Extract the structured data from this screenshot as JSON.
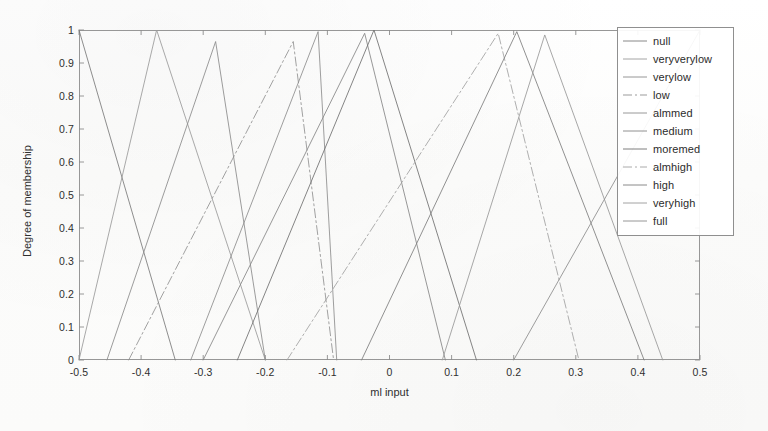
{
  "chart_data": {
    "type": "line",
    "title": "",
    "subtitle": "",
    "xlabel": "ml input",
    "ylabel": "Degree of membership",
    "xlim": [
      -0.5,
      0.5
    ],
    "ylim": [
      0,
      1
    ],
    "xticks": [
      "-0.5",
      "-0.4",
      "-0.3",
      "-0.2",
      "-0.1",
      "0",
      "0.1",
      "0.2",
      "0.3",
      "0.4",
      "0.5"
    ],
    "xtick_values": [
      -0.5,
      -0.4,
      -0.3,
      -0.2,
      -0.1,
      0,
      0.1,
      0.2,
      0.3,
      0.4,
      0.5
    ],
    "yticks": [
      "0",
      "0.1",
      "0.2",
      "0.3",
      "0.4",
      "0.5",
      "0.6",
      "0.7",
      "0.8",
      "0.9",
      "1"
    ],
    "ytick_values": [
      0,
      0.1,
      0.2,
      0.3,
      0.4,
      0.5,
      0.6,
      0.7,
      0.8,
      0.9,
      1
    ],
    "grid": false,
    "legend_position": "top-right",
    "line_color": "#6e6e6e",
    "series": [
      {
        "name": "null",
        "style": "solid",
        "color": "#7a7a7a",
        "x": [
          -0.5,
          -0.5,
          -0.345,
          -0.5
        ],
        "y": [
          0,
          1,
          0,
          0
        ],
        "peak": -0.5,
        "points": [
          [
            -0.5,
            1
          ],
          [
            -0.345,
            0
          ]
        ]
      },
      {
        "name": "veryverylow",
        "style": "solid",
        "color": "#9a9a9a",
        "x": [
          -0.5,
          -0.375,
          -0.2
        ],
        "y": [
          0,
          1,
          0
        ],
        "peak": -0.375,
        "points": [
          [
            -0.5,
            0
          ],
          [
            -0.375,
            1
          ],
          [
            -0.2,
            0
          ]
        ]
      },
      {
        "name": "verylow",
        "style": "solid",
        "color": "#8a8a8a",
        "x": [
          -0.455,
          -0.28,
          -0.2
        ],
        "y": [
          0,
          0.965,
          0
        ],
        "peak": -0.28,
        "points": [
          [
            -0.455,
            0
          ],
          [
            -0.28,
            0.965
          ],
          [
            -0.2,
            0
          ]
        ]
      },
      {
        "name": "low",
        "style": "dashdot",
        "color": "#909090",
        "x": [
          -0.42,
          -0.155,
          -0.09
        ],
        "y": [
          0,
          0.965,
          0
        ],
        "peak": -0.155,
        "points": [
          [
            -0.42,
            0
          ],
          [
            -0.155,
            0.965
          ],
          [
            -0.09,
            0
          ]
        ]
      },
      {
        "name": "almmed",
        "style": "solid",
        "color": "#8d8d8d",
        "x": [
          -0.32,
          -0.115,
          -0.085
        ],
        "y": [
          0,
          0.995,
          0
        ],
        "peak": -0.115,
        "points": [
          [
            -0.32,
            0
          ],
          [
            -0.115,
            0.995
          ],
          [
            -0.085,
            0
          ]
        ]
      },
      {
        "name": "medium",
        "style": "solid",
        "color": "#858585",
        "x": [
          -0.3,
          -0.04,
          0.09
        ],
        "y": [
          0,
          0.99,
          0
        ],
        "peak": -0.04,
        "points": [
          [
            -0.3,
            0
          ],
          [
            -0.04,
            0.99
          ],
          [
            0.09,
            0
          ]
        ]
      },
      {
        "name": "moremed",
        "style": "solid",
        "color": "#6f6f6f",
        "x": [
          -0.245,
          -0.025,
          0.14
        ],
        "y": [
          0,
          1.0,
          0
        ],
        "peak": -0.025,
        "points": [
          [
            -0.245,
            0
          ],
          [
            -0.025,
            1.0
          ],
          [
            0.14,
            0
          ]
        ]
      },
      {
        "name": "almhigh",
        "style": "dashdot",
        "color": "#a0a0a0",
        "x": [
          -0.165,
          0.175,
          0.305
        ],
        "y": [
          0,
          0.99,
          0
        ],
        "peak": 0.175,
        "points": [
          [
            -0.165,
            0
          ],
          [
            0.175,
            0.99
          ],
          [
            0.305,
            0
          ]
        ]
      },
      {
        "name": "high",
        "style": "solid",
        "color": "#7d7d7d",
        "x": [
          -0.045,
          0.205,
          0.41
        ],
        "y": [
          0,
          0.995,
          0
        ],
        "peak": 0.205,
        "points": [
          [
            -0.045,
            0
          ],
          [
            0.205,
            0.995
          ],
          [
            0.41,
            0
          ]
        ]
      },
      {
        "name": "veryhigh",
        "style": "solid",
        "color": "#979797",
        "x": [
          0.085,
          0.25,
          0.44
        ],
        "y": [
          0,
          0.985,
          0
        ],
        "peak": 0.25,
        "points": [
          [
            0.085,
            0
          ],
          [
            0.25,
            0.985
          ],
          [
            0.44,
            0
          ]
        ]
      },
      {
        "name": "full",
        "style": "solid",
        "color": "#8b8b8b",
        "x": [
          0.2,
          0.5,
          0.5
        ],
        "y": [
          0,
          1,
          0
        ],
        "peak": 0.5,
        "points": [
          [
            0.2,
            0
          ],
          [
            0.5,
            1
          ]
        ]
      }
    ]
  },
  "legend": {
    "items": [
      {
        "label": "null"
      },
      {
        "label": "veryverylow"
      },
      {
        "label": "verylow"
      },
      {
        "label": "low"
      },
      {
        "label": "almmed"
      },
      {
        "label": "medium"
      },
      {
        "label": "moremed"
      },
      {
        "label": "almhigh"
      },
      {
        "label": "high"
      },
      {
        "label": "veryhigh"
      },
      {
        "label": "full"
      }
    ]
  }
}
